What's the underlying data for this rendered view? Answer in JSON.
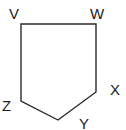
{
  "diagram": {
    "type": "pentagon",
    "stroke_color": "#2a2a2a",
    "stroke_width": 1.4,
    "vertices": [
      {
        "name": "V",
        "x": 21,
        "y": 24
      },
      {
        "name": "W",
        "x": 96,
        "y": 24
      },
      {
        "name": "X",
        "x": 96,
        "y": 92
      },
      {
        "name": "Y",
        "x": 58,
        "y": 120
      },
      {
        "name": "Z",
        "x": 21,
        "y": 101
      }
    ],
    "labels": {
      "V": "V",
      "W": "W",
      "X": "X",
      "Y": "Y",
      "Z": "Z"
    }
  }
}
